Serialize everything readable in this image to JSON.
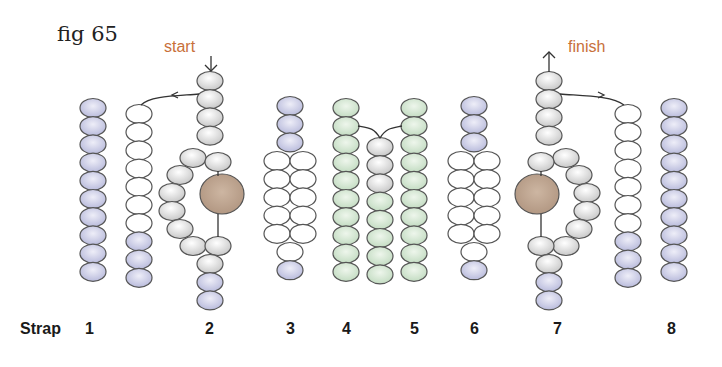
{
  "figure": {
    "title": "fig 65",
    "start_label": "start",
    "finish_label": "finish",
    "colors": {
      "lavender": "#c9cbe6",
      "green": "#d5e6d4",
      "white": "#ffffff",
      "grey": "#e6e6e6",
      "focal_bead": "#bfa58f",
      "annotation": "#c8703a",
      "outline": "#444444"
    }
  },
  "strap_labels": {
    "prefix": "Strap",
    "numbers": [
      "1",
      "2",
      "3",
      "4",
      "5",
      "6",
      "7",
      "8"
    ]
  },
  "straps": [
    {
      "id": "1",
      "columns": [
        {
          "beads": [
            "lavender",
            "lavender",
            "lavender",
            "lavender",
            "lavender",
            "lavender",
            "lavender",
            "lavender",
            "lavender",
            "lavender"
          ]
        },
        {
          "beads": [
            "white",
            "white",
            "white",
            "white",
            "white",
            "white",
            "white",
            "lavender",
            "lavender",
            "lavender"
          ]
        }
      ]
    },
    {
      "id": "2",
      "top": [
        "grey",
        "grey",
        "grey",
        "grey"
      ],
      "loop_outer": [
        "grey",
        "grey",
        "grey",
        "grey",
        "grey",
        "grey"
      ],
      "loop_inner": [
        "grey",
        "focal",
        "grey"
      ],
      "bottom": [
        "grey",
        "lavender",
        "lavender"
      ]
    },
    {
      "id": "3",
      "top": [
        "lavender",
        "lavender",
        "lavender"
      ],
      "pairs": 5,
      "pair_color": "white",
      "bottom": [
        "white",
        "lavender"
      ]
    },
    {
      "id": "4",
      "beads": [
        "green",
        "green",
        "green",
        "green",
        "green",
        "green",
        "green",
        "green",
        "green",
        "green"
      ]
    },
    {
      "id": "4-5 center",
      "beads": [
        "grey",
        "grey",
        "grey",
        "green",
        "green",
        "green",
        "green",
        "green"
      ]
    },
    {
      "id": "5",
      "beads": [
        "green",
        "green",
        "green",
        "green",
        "green",
        "green",
        "green",
        "green",
        "green",
        "green"
      ]
    },
    {
      "id": "6",
      "top": [
        "lavender",
        "lavender",
        "lavender"
      ],
      "pairs": 5,
      "pair_color": "white",
      "bottom": [
        "white",
        "lavender"
      ]
    },
    {
      "id": "7",
      "top": [
        "grey",
        "grey",
        "grey",
        "grey"
      ],
      "loop_outer": [
        "grey",
        "grey",
        "grey",
        "grey",
        "grey",
        "grey"
      ],
      "loop_inner": [
        "grey",
        "focal",
        "grey"
      ],
      "bottom": [
        "grey",
        "lavender",
        "lavender"
      ]
    },
    {
      "id": "8",
      "columns": [
        {
          "beads": [
            "white",
            "white",
            "white",
            "white",
            "white",
            "white",
            "white",
            "lavender",
            "lavender",
            "lavender"
          ]
        },
        {
          "beads": [
            "lavender",
            "lavender",
            "lavender",
            "lavender",
            "lavender",
            "lavender",
            "lavender",
            "lavender",
            "lavender",
            "lavender"
          ]
        }
      ]
    }
  ]
}
